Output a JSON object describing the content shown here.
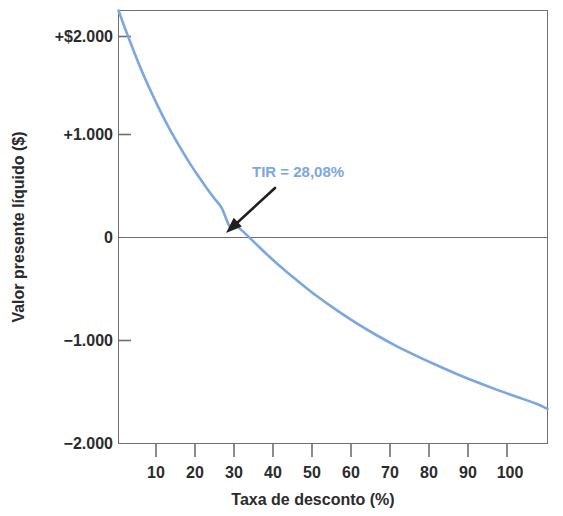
{
  "chart_data": {
    "type": "line",
    "title": "",
    "xlabel": "Taxa de desconto (%)",
    "ylabel": "Valor presente líquido ($)",
    "xlim": [
      0,
      108
    ],
    "ylim": [
      -2000,
      2000
    ],
    "grid": false,
    "legend": "none",
    "line_color": "#7ba7e0",
    "axis_color": "#6f6f6f",
    "zero_line_color": "#6f6f6f",
    "x_ticks": [
      10,
      20,
      30,
      40,
      50,
      60,
      70,
      80,
      90,
      100
    ],
    "x_tick_labels": [
      "10",
      "20",
      "30",
      "40",
      "50",
      "60",
      "70",
      "80",
      "90",
      "100"
    ],
    "y_ticks": [
      2000,
      1000,
      0,
      -1000,
      -2000
    ],
    "y_tick_labels": [
      "+$2.000",
      "+1.000",
      "0",
      "−1.000",
      "−2.000"
    ],
    "series": [
      {
        "name": "Valor presente líquido",
        "x": [
          0,
          2,
          4,
          6,
          8,
          10,
          12,
          14,
          16,
          18,
          20,
          22,
          24,
          26,
          28.08,
          30,
          34,
          38,
          42,
          46,
          50,
          55,
          60,
          65,
          70,
          75,
          80,
          85,
          90,
          95,
          100,
          105,
          108
        ],
        "y": [
          2000,
          1800,
          1610,
          1430,
          1265,
          1110,
          965,
          830,
          705,
          585,
          475,
          370,
          270,
          175,
          0,
          0,
          -135,
          -275,
          -405,
          -525,
          -640,
          -770,
          -890,
          -1000,
          -1100,
          -1190,
          -1275,
          -1355,
          -1430,
          -1500,
          -1565,
          -1630,
          -1680
        ]
      }
    ],
    "annotations": [
      {
        "name": "irr-annotation",
        "text": "TIR = 28,08%",
        "color": "#7ba7e0",
        "text_x": 252,
        "text_y": 177,
        "arrow_from_x": 275,
        "arrow_from_y": 188,
        "arrow_to_x": 226,
        "arrow_to_y": 233,
        "arrow_color": "#231f1c"
      }
    ],
    "irr_value": "28,08%",
    "crossing_point": {
      "x": 28.08,
      "y": 0
    }
  }
}
